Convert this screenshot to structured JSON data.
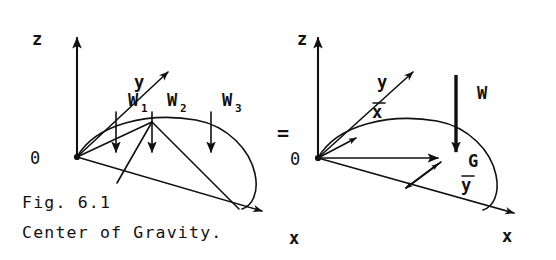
{
  "figure": {
    "caption_line1": "Fig. 6.1",
    "caption_line2": "Center of Gravity.",
    "equals_sign": "=",
    "ink_color": "#111111",
    "background_color": "#ffffff"
  },
  "left_diagram": {
    "name": "discrete-weights-lamina",
    "axes": {
      "z_label": "z",
      "y_label": "y",
      "x_label": "x",
      "origin_label": "0"
    },
    "forces": [
      {
        "label": "W",
        "subscript": "1"
      },
      {
        "label": "W",
        "subscript": "2"
      },
      {
        "label": "W",
        "subscript": "3"
      }
    ]
  },
  "right_diagram": {
    "name": "resultant-weight-lamina",
    "axes": {
      "z_label": "z",
      "y_label": "y",
      "x_label": "x",
      "origin_label": "0"
    },
    "centroid_label": "G",
    "resultant_force_label": "W",
    "xbar_label": "x",
    "ybar_label": "y"
  }
}
